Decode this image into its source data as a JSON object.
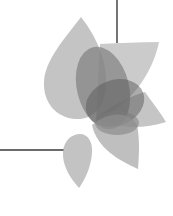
{
  "graphic": {
    "description": "Decorative gray overlapping petal logo with two thin connector lines",
    "colors": {
      "background": "#ffffff",
      "line": "#3a3a3a",
      "petal_light": "#b4b4b4",
      "petal_mid": "#8e8e8e",
      "petal_dark": "#5e5e5e"
    },
    "petal_count": 7
  }
}
